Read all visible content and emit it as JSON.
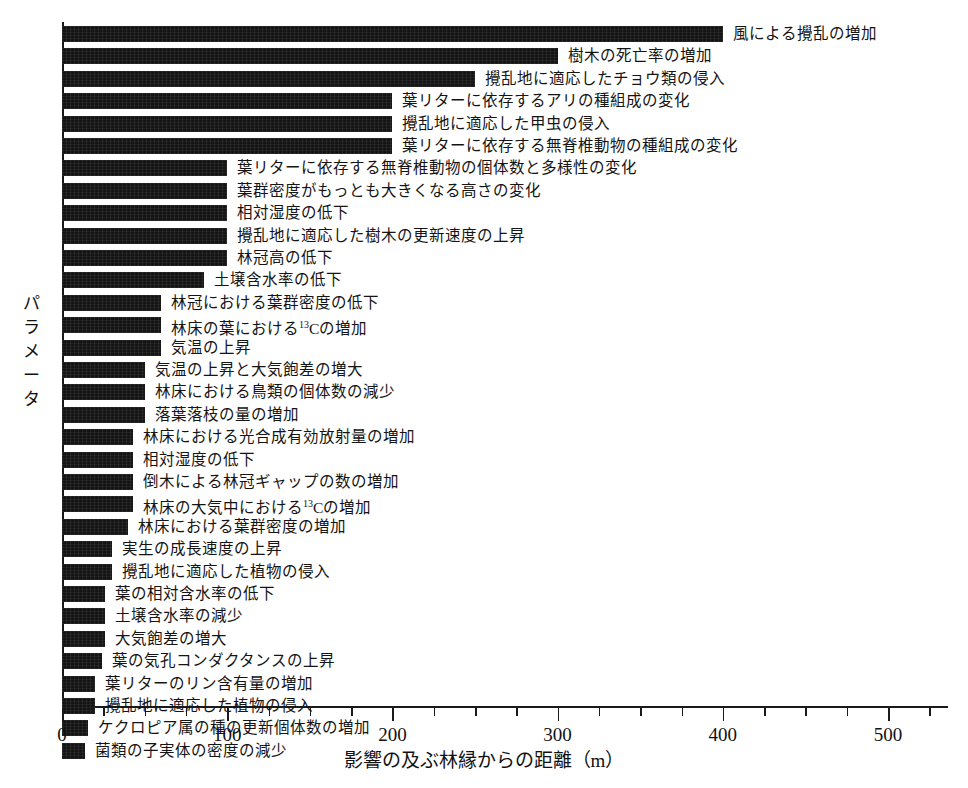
{
  "chart_data": {
    "type": "bar",
    "orientation": "horizontal",
    "title": "",
    "xlabel": "影響の及ぶ林縁からの距離（m）",
    "ylabel": "パラメータ",
    "xlim": [
      0,
      540
    ],
    "xticks": [
      0,
      100,
      200,
      300,
      400,
      500
    ],
    "xtick_labels": [
      "0",
      "100",
      "200",
      "300",
      "400",
      "500"
    ],
    "minor_tick_step": 25,
    "grid": false,
    "legend": null,
    "bar_color": "#141414",
    "units": "m",
    "categories": [
      "風による攪乱の増加",
      "樹木の死亡率の増加",
      "攪乱地に適応したチョウ類の侵入",
      "葉リターに依存するアリの種組成の変化",
      "攪乱地に適応した甲虫の侵入",
      "葉リターに依存する無脊椎動物の種組成の変化",
      "葉リターに依存する無脊椎動物の個体数と多様性の変化",
      "葉群密度がもっとも大きくなる高さの変化",
      "相対湿度の低下",
      "攪乱地に適応した樹木の更新速度の上昇",
      "林冠高の低下",
      "土壌含水率の低下",
      "林冠における葉群密度の低下",
      "林床の葉における¹³Cの増加",
      "気温の上昇",
      "気温の上昇と大気飽差の増大",
      "林床における鳥類の個体数の減少",
      "落葉落枝の量の増加",
      "林床における光合成有効放射量の増加",
      "相対湿度の低下",
      "倒木による林冠ギャップの数の増加",
      "林床の大気中における¹³Cの増加",
      "林床における葉群密度の増加",
      "実生の成長速度の上昇",
      "攪乱地に適応した植物の侵入",
      "葉の相対含水率の低下",
      "土壌含水率の減少",
      "大気飽差の増大",
      "葉の気孔コンダクタンスの上昇",
      "葉リターのリン含有量の増加",
      "攪乱地に適応した植物の侵入",
      "ケクロピア属の種の更新個体数の増加",
      "菌類の子実体の密度の減少"
    ],
    "values": [
      400,
      300,
      250,
      200,
      200,
      200,
      100,
      100,
      100,
      100,
      100,
      86,
      60,
      60,
      60,
      50,
      50,
      50,
      43,
      43,
      43,
      43,
      40,
      30,
      30,
      26,
      26,
      26,
      24,
      20,
      20,
      16,
      14
    ]
  }
}
